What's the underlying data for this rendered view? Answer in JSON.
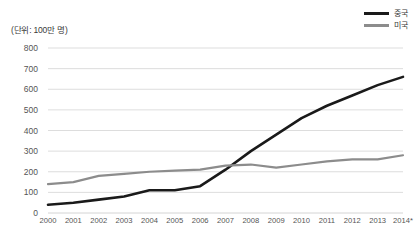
{
  "chart_data": {
    "type": "line",
    "title": "",
    "unit_note": "(단위: 100만 명)",
    "xlabel": "(년)",
    "ylabel": "",
    "ylim": [
      0,
      800
    ],
    "ytick_step": 100,
    "grid": true,
    "legend_position": "top-right",
    "categories": [
      "2000",
      "2001",
      "2002",
      "2003",
      "2004",
      "2005",
      "2006",
      "2007",
      "2008",
      "2009",
      "2010",
      "2011",
      "2012",
      "2013",
      "2014*"
    ],
    "yticks": [
      "0",
      "100",
      "200",
      "300",
      "400",
      "500",
      "600",
      "700",
      "800"
    ],
    "series": [
      {
        "name": "중국",
        "color": "#1a1a1a",
        "values": [
          40,
          50,
          65,
          80,
          110,
          110,
          130,
          210,
          300,
          380,
          460,
          520,
          570,
          620,
          660
        ]
      },
      {
        "name": "미국",
        "color": "#8c8c8c",
        "values": [
          140,
          150,
          180,
          190,
          200,
          205,
          210,
          230,
          235,
          220,
          235,
          250,
          260,
          260,
          280
        ]
      }
    ]
  }
}
